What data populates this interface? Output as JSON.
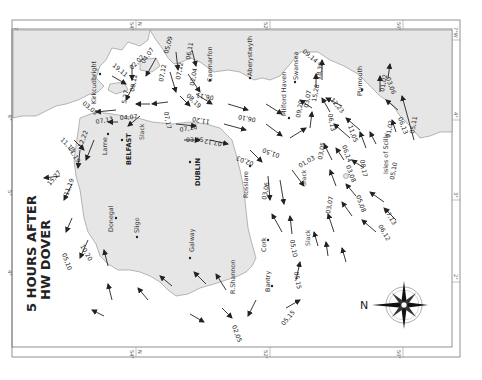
{
  "title": {
    "line1": "5 HOURS AFTER",
    "line2": "HW DOVER"
  },
  "compass": {
    "north_label": "N"
  },
  "border_ticks": {
    "top": [
      "7°W",
      "54°",
      "N",
      "52°",
      "50°",
      "7°W"
    ],
    "bottom": [
      "54°",
      "N",
      "52°",
      "50°"
    ],
    "left": [
      "7°W",
      "6°",
      "5°",
      "4°"
    ],
    "right": [
      "5°",
      "4°",
      "3°",
      "2°"
    ]
  },
  "places": {
    "kirkcudbright": "Kirkcudbright",
    "larne": "Larne",
    "belfast": "BELFAST",
    "donegal": "Donegal",
    "sligo": "Sligo",
    "galway": "Galway",
    "dublin": "DUBLIN",
    "rosslare": "Rosslare",
    "cork": "Cork",
    "shannon": "R.Shannon",
    "bantry": "Bantry",
    "caernarfon": "Caernarfon",
    "aberystwyth": "Aberystwyth",
    "milford_haven": "Milford Haven",
    "swansea": "Swansea",
    "plymouth": "Plymouth",
    "scilly": "Isles of Scilly"
  },
  "slack_labels": [
    "Slack",
    "Slack",
    "Slack"
  ],
  "rates": [
    "19,11",
    "02,02",
    "04,07",
    "05,09",
    "06,11",
    "07,12",
    "07,12",
    "02,04",
    "08,12",
    "5,27",
    "03,05",
    "07,13",
    "04,07",
    "08,19",
    "07,17",
    "11,13",
    "11,19",
    "12,22",
    "15,27",
    "11,19",
    "10,20",
    "05,10",
    "07,16",
    "06,11",
    "03,05",
    "07,12",
    "06,10",
    "11,20",
    "02,03",
    "01,50",
    "01,03",
    "03,06",
    "05,10",
    "05,15",
    "05,15",
    "02,05",
    "09,20",
    "15,28",
    "18,38",
    "03,07",
    "09,14",
    "12,23",
    "06,13",
    "11,05",
    "06,14",
    "03,05",
    "08,17",
    "03,08",
    "03,07",
    "05,08",
    "07,13",
    "06,12",
    "05,10",
    "03,06",
    "01,02",
    "06,13",
    "01,02",
    "05,11"
  ]
}
